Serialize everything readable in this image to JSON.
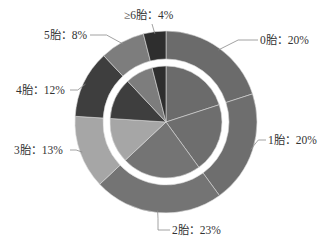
{
  "chart_data": {
    "type": "pie",
    "variant": "pie-with-outer-donut-ring",
    "title": "",
    "categories": [
      "0胎",
      "1胎",
      "2胎",
      "3胎",
      "4胎",
      "5胎",
      "≥6胎"
    ],
    "values": [
      20,
      20,
      23,
      13,
      12,
      8,
      4
    ],
    "unit": "%",
    "labels": [
      "0胎：20%",
      "1胎：20%",
      "2胎：23%",
      "3胎：13%",
      "4胎：12%",
      "5胎：8%",
      "≥6胎：4%"
    ],
    "colors": [
      "#6b6b6b",
      "#6e6e6e",
      "#747474",
      "#a6a6a6",
      "#3e3e3e",
      "#7d7d7d",
      "#2e2e2e"
    ],
    "start_angle_deg": 0,
    "direction": "clockwise",
    "legend": "none",
    "geometry": {
      "cx": 166,
      "cy": 122,
      "outer_r": 91,
      "ring_inner_r": 63,
      "pie_r": 56
    }
  }
}
